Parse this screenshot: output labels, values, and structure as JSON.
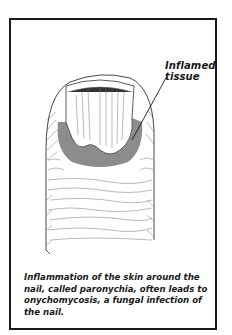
{
  "figure": {
    "callout_label": "Inflamed tissue",
    "callout_lines": [
      "Inflamed",
      "tissue"
    ],
    "caption": "Inflammation of the skin around the nail, called paronychia, often leads to onychomycosis, a fungal infection of the nail.",
    "colors": {
      "border": "#1a1a1a",
      "inflamed_tissue": "#8c8c8c",
      "line_art": "#333333",
      "background": "#ffffff"
    }
  }
}
